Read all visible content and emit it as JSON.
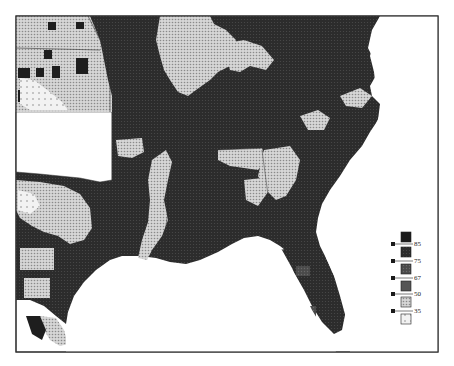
{
  "map": {
    "type": "choropleth",
    "region": "Southeastern United States",
    "colors": {
      "class_6": "#1a1a1a",
      "class_5": "#2a2a2a",
      "class_4": "#3c3c3c",
      "class_3": "#555555",
      "class_2": "#bdbdbd",
      "class_1": "#f0f0f0",
      "border": "#333333",
      "water": "#ffffff"
    }
  },
  "legend": {
    "breaks": [
      "85",
      "75",
      "67",
      "50",
      "35"
    ],
    "classes": 6
  }
}
